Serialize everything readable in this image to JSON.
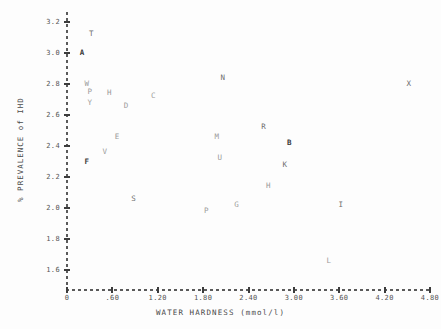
{
  "chart_data": {
    "type": "scatter",
    "title": "",
    "xlabel": "WATER HARDNESS (mmol/l)",
    "ylabel": "% PREVALENCE of IHD",
    "xlim": [
      0,
      4.8
    ],
    "ylim": [
      1.6,
      3.2
    ],
    "grid": false,
    "legend": "none",
    "marker_style": "letter-labels",
    "xticks": [
      {
        "value": 0,
        "label": "0"
      },
      {
        "value": 0.6,
        "label": ".60"
      },
      {
        "value": 1.2,
        "label": "1.20"
      },
      {
        "value": 1.8,
        "label": "1.80"
      },
      {
        "value": 2.4,
        "label": "2.40"
      },
      {
        "value": 3.0,
        "label": "3.00"
      },
      {
        "value": 3.6,
        "label": "3.60"
      },
      {
        "value": 4.2,
        "label": "4.20"
      },
      {
        "value": 4.8,
        "label": "4.80"
      }
    ],
    "yticks": [
      {
        "value": 3.2,
        "label": "3.2"
      },
      {
        "value": 3.0,
        "label": "3.0"
      },
      {
        "value": 2.8,
        "label": "2.8"
      },
      {
        "value": 2.6,
        "label": "2.6"
      },
      {
        "value": 2.4,
        "label": "2.4"
      },
      {
        "value": 2.2,
        "label": "2.2"
      },
      {
        "value": 2.0,
        "label": "2.0"
      },
      {
        "value": 1.8,
        "label": "1.8"
      },
      {
        "value": 1.6,
        "label": "1.6"
      }
    ],
    "points": [
      {
        "label": "T",
        "x": 0.32,
        "y": 3.12,
        "weight": "mid"
      },
      {
        "label": "A",
        "x": 0.2,
        "y": 3.0,
        "weight": "bold"
      },
      {
        "label": "W",
        "x": 0.26,
        "y": 2.8,
        "weight": "faint"
      },
      {
        "label": "P",
        "x": 0.3,
        "y": 2.75,
        "weight": "faint"
      },
      {
        "label": "Y",
        "x": 0.3,
        "y": 2.68,
        "weight": "faint"
      },
      {
        "label": "H",
        "x": 0.56,
        "y": 2.74,
        "weight": "faint"
      },
      {
        "label": "D",
        "x": 0.78,
        "y": 2.66,
        "weight": "faint"
      },
      {
        "label": "C",
        "x": 1.14,
        "y": 2.72,
        "weight": "faint"
      },
      {
        "label": "N",
        "x": 2.06,
        "y": 2.84,
        "weight": "mid"
      },
      {
        "label": "X",
        "x": 4.52,
        "y": 2.8,
        "weight": "mid"
      },
      {
        "label": "E",
        "x": 0.66,
        "y": 2.46,
        "weight": "faint"
      },
      {
        "label": "V",
        "x": 0.5,
        "y": 2.36,
        "weight": "faint"
      },
      {
        "label": "M",
        "x": 1.98,
        "y": 2.46,
        "weight": "faint"
      },
      {
        "label": "R",
        "x": 2.6,
        "y": 2.52,
        "weight": "mid"
      },
      {
        "label": "B",
        "x": 2.94,
        "y": 2.42,
        "weight": "bold"
      },
      {
        "label": "F",
        "x": 0.26,
        "y": 2.3,
        "weight": "bold"
      },
      {
        "label": "U",
        "x": 2.02,
        "y": 2.32,
        "weight": "faint"
      },
      {
        "label": "K",
        "x": 2.88,
        "y": 2.28,
        "weight": "mid"
      },
      {
        "label": "S",
        "x": 0.88,
        "y": 2.06,
        "weight": "mid"
      },
      {
        "label": "H",
        "x": 2.66,
        "y": 2.14,
        "weight": "faint"
      },
      {
        "label": "G",
        "x": 2.24,
        "y": 2.02,
        "weight": "faint"
      },
      {
        "label": "P",
        "x": 1.84,
        "y": 1.98,
        "weight": "faint"
      },
      {
        "label": "I",
        "x": 3.62,
        "y": 2.02,
        "weight": "mid"
      },
      {
        "label": "L",
        "x": 3.46,
        "y": 1.66,
        "weight": "faint"
      }
    ]
  }
}
